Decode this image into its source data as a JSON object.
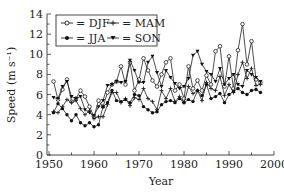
{
  "chart_data": {
    "type": "line",
    "title": "",
    "xlabel": "Year",
    "ylabel": "Speed (m s⁻¹)",
    "xlim": [
      1950,
      2000
    ],
    "ylim": [
      0,
      14
    ],
    "x_ticks": [
      1950,
      1960,
      1970,
      1980,
      1990,
      2000
    ],
    "y_ticks": [
      0,
      2,
      4,
      6,
      8,
      10,
      12,
      14
    ],
    "grid": false,
    "legend_position": "upper-left (inside, boxed)",
    "x": [
      1951,
      1952,
      1953,
      1954,
      1955,
      1956,
      1957,
      1958,
      1959,
      1960,
      1961,
      1962,
      1963,
      1964,
      1965,
      1966,
      1967,
      1968,
      1969,
      1970,
      1971,
      1972,
      1973,
      1974,
      1975,
      1976,
      1977,
      1978,
      1979,
      1980,
      1981,
      1982,
      1983,
      1984,
      1985,
      1986,
      1987,
      1988,
      1989,
      1990,
      1991,
      1992,
      1993,
      1994,
      1995,
      1996,
      1997
    ],
    "series": [
      {
        "name": "DJF",
        "marker": "open-circle",
        "values": [
          7.3,
          5.5,
          6.5,
          7.5,
          5.3,
          5.6,
          6.4,
          5.8,
          4.8,
          3.8,
          5.4,
          4.8,
          6.2,
          7.0,
          7.3,
          8.8,
          7.0,
          9.2,
          6.4,
          7.5,
          9.6,
          8.4,
          7.4,
          6.8,
          8.0,
          9.2,
          9.6,
          6.4,
          7.0,
          5.6,
          8.8,
          6.6,
          7.4,
          6.4,
          7.9,
          7.0,
          10.3,
          10.8,
          6.8,
          9.8,
          6.6,
          10.4,
          13.0,
          9.0,
          11.3,
          7.5,
          7.2
        ]
      },
      {
        "name": "MAM",
        "marker": "plus",
        "values": [
          4.3,
          4.2,
          4.8,
          5.5,
          5.2,
          5.4,
          4.6,
          4.0,
          4.4,
          3.6,
          3.8,
          3.8,
          5.0,
          6.2,
          6.2,
          5.2,
          5.6,
          4.9,
          5.7,
          5.5,
          6.6,
          5.6,
          5.3,
          4.5,
          6.4,
          5.6,
          6.6,
          5.3,
          5.8,
          5.2,
          6.8,
          6.1,
          6.4,
          5.4,
          7.2,
          6.6,
          6.4,
          7.8,
          5.9,
          7.0,
          6.2,
          8.0,
          9.2,
          7.6,
          8.6,
          6.9,
          7.0
        ]
      },
      {
        "name": "JJA",
        "marker": "filled-circle",
        "values": [
          4.2,
          5.1,
          4.6,
          4.0,
          3.4,
          4.0,
          3.2,
          2.9,
          3.2,
          2.8,
          3.0,
          4.8,
          5.2,
          6.4,
          5.4,
          5.3,
          5.5,
          5.2,
          6.0,
          5.9,
          4.8,
          4.5,
          4.2,
          4.3,
          5.0,
          5.3,
          5.4,
          5.2,
          5.6,
          5.2,
          5.5,
          5.3,
          6.4,
          5.9,
          7.0,
          5.6,
          5.8,
          6.1,
          5.2,
          6.0,
          6.3,
          6.6,
          6.2,
          6.0,
          6.4,
          6.5,
          6.2
        ]
      },
      {
        "name": "SON",
        "marker": "filled-triangle",
        "values": [
          5.7,
          5.6,
          6.8,
          7.3,
          5.8,
          5.6,
          5.8,
          4.5,
          4.2,
          3.9,
          4.8,
          5.4,
          6.9,
          7.0,
          7.3,
          7.2,
          7.3,
          9.4,
          8.4,
          7.2,
          7.2,
          9.2,
          9.8,
          8.2,
          6.8,
          8.4,
          7.7,
          7.1,
          6.6,
          6.8,
          7.6,
          9.9,
          10.3,
          9.0,
          8.3,
          8.0,
          7.3,
          8.6,
          7.0,
          7.6,
          8.0,
          7.0,
          6.8,
          8.4,
          8.0,
          7.7,
          7.3
        ]
      }
    ]
  },
  "legend": {
    "items": [
      {
        "symbol_label": "= DJF"
      },
      {
        "symbol_label": "= MAM"
      },
      {
        "symbol_label": "= JJA"
      },
      {
        "symbol_label": "= SON"
      }
    ]
  }
}
